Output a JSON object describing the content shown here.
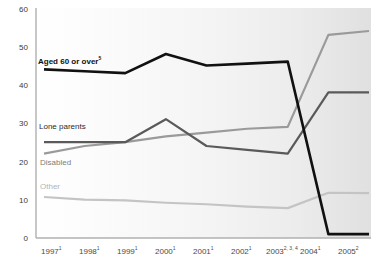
{
  "chart_data": {
    "type": "line",
    "title": "",
    "subtitle": "",
    "xlabel": "",
    "ylabel": "",
    "ylim": [
      0,
      60
    ],
    "yticks": [
      0,
      10,
      20,
      30,
      40,
      50,
      60
    ],
    "grid": false,
    "legend_position": "inline-labels",
    "categories": [
      "1997",
      "1998",
      "1999",
      "2000",
      "2001",
      "2002",
      "2003",
      "2004",
      "2005"
    ],
    "category_superscripts": [
      "1",
      "1",
      "1",
      "1",
      "1",
      "1",
      "2, 3, 4",
      "1",
      "2"
    ],
    "series": [
      {
        "name": "Aged 60 or over",
        "superscript": "5",
        "color": "#111111",
        "width": 2.6,
        "values": [
          44,
          43.5,
          43,
          48,
          45,
          45.5,
          46,
          1,
          1
        ]
      },
      {
        "name": "Lone parents",
        "superscript": "",
        "color": "#5a5a5a",
        "width": 2.2,
        "values": [
          25,
          25,
          25,
          31,
          24,
          23,
          22,
          38,
          38
        ]
      },
      {
        "name": "Disabled",
        "superscript": "",
        "color": "#9a9a9a",
        "width": 2.2,
        "values": [
          22,
          24,
          25,
          26.5,
          27.5,
          28.5,
          29,
          53,
          54
        ]
      },
      {
        "name": "Other",
        "superscript": "",
        "color": "#c4c4c4",
        "width": 2.2,
        "values": [
          10.7,
          10,
          9.8,
          9.2,
          8.8,
          8.2,
          7.8,
          11.8,
          11.7
        ]
      }
    ]
  },
  "axis": {
    "y_labels": [
      "60",
      "50",
      "40",
      "30",
      "20",
      "10",
      "0"
    ],
    "x_labels": [
      {
        "year": "1997",
        "sup": "1"
      },
      {
        "year": "1998",
        "sup": "1"
      },
      {
        "year": "1999",
        "sup": "1"
      },
      {
        "year": "2000",
        "sup": "1"
      },
      {
        "year": "2001",
        "sup": "1"
      },
      {
        "year": "2002",
        "sup": "1"
      },
      {
        "year": "2003",
        "sup": "2, 3, 4"
      },
      {
        "year": "2004",
        "sup": "1"
      },
      {
        "year": "2005",
        "sup": "2"
      }
    ]
  },
  "labels": {
    "aged": "Aged 60 or over",
    "aged_sup": "5",
    "lone": "Lone parents",
    "disabled": "Disabled",
    "other": "Other"
  },
  "colors": {
    "aged": "#111111",
    "lone": "#5a5a5a",
    "disabled": "#9a9a9a",
    "other": "#c4c4c4",
    "axis": "#b0b0b0",
    "plot_bg_left": "#ffffff",
    "plot_bg_right": "#e2e2e2"
  }
}
